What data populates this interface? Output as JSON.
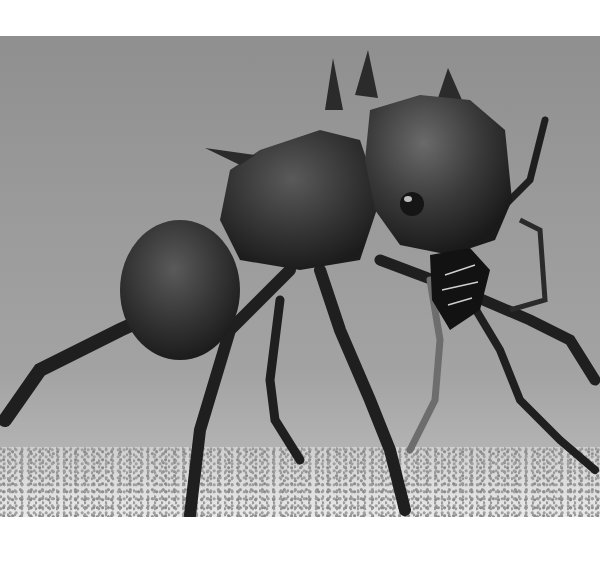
{
  "image": {
    "subject": "spiny ant (macro photograph)",
    "style": "black-and-white photograph",
    "colors": {
      "background_gray": "#999999",
      "ant_body": "#2a2a2a",
      "ground": "#d8d8d8",
      "border": "#ffffff"
    }
  }
}
